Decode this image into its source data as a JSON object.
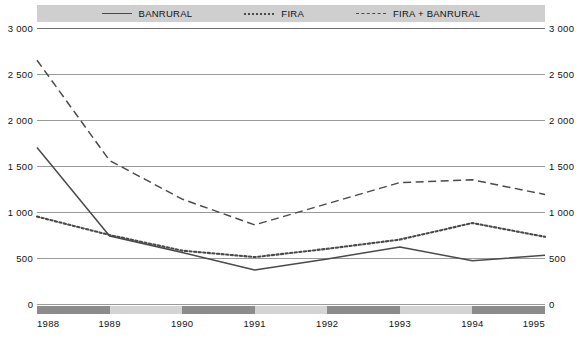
{
  "legend": {
    "items": [
      {
        "label": "BANRURAL",
        "style": "solid",
        "color": "#4a4a4a"
      },
      {
        "label": "FIRA",
        "style": "dotted",
        "color": "#4a4a4a"
      },
      {
        "label": "FIRA + BANRURAL",
        "style": "dashed",
        "color": "#4a4a4a"
      }
    ]
  },
  "axis": {
    "y_ticks_left": [
      "3 000",
      "2 500",
      "2 000",
      "1 500",
      "1 000",
      "500",
      "0"
    ],
    "y_ticks_right": [
      "3 000",
      "2 500",
      "2 000",
      "1 500",
      "1 000",
      "500",
      "0"
    ],
    "x_ticks": [
      "1988",
      "1989",
      "1990",
      "1991",
      "1992",
      "1993",
      "1994",
      "1995"
    ],
    "zero_left": "0",
    "zero_right": "0"
  },
  "chart_data": {
    "type": "line",
    "title": "",
    "subtitle": "",
    "xlabel": "",
    "ylabel": "",
    "x": [
      1988,
      1989,
      1990,
      1991,
      1992,
      1993,
      1994,
      1995
    ],
    "categories": [
      "1988",
      "1989",
      "1990",
      "1991",
      "1992",
      "1993",
      "1994",
      "1995"
    ],
    "ylim": [
      0,
      3000
    ],
    "ytick_values": [
      0,
      500,
      1000,
      1500,
      2000,
      2500,
      3000
    ],
    "grid": true,
    "legend_position": "top",
    "series": [
      {
        "name": "BANRURAL",
        "style": "solid",
        "color": "#4a4a4a",
        "values": [
          1700,
          740,
          560,
          370,
          490,
          620,
          470,
          530
        ]
      },
      {
        "name": "FIRA",
        "style": "dotted",
        "color": "#4a4a4a",
        "values": [
          950,
          750,
          580,
          510,
          600,
          700,
          880,
          730
        ]
      },
      {
        "name": "FIRA + BANRURAL",
        "style": "dashed",
        "color": "#4a4a4a",
        "values": [
          2650,
          1560,
          1140,
          860,
          1090,
          1320,
          1350,
          1190
        ]
      }
    ]
  },
  "xband": {
    "segments": [
      {
        "from": "1988",
        "to": "1989",
        "shade": "dark"
      },
      {
        "from": "1989",
        "to": "1990",
        "shade": "light"
      },
      {
        "from": "1990",
        "to": "1991",
        "shade": "dark"
      },
      {
        "from": "1991",
        "to": "1992",
        "shade": "light"
      },
      {
        "from": "1992",
        "to": "1993",
        "shade": "dark"
      },
      {
        "from": "1993",
        "to": "1994",
        "shade": "light"
      },
      {
        "from": "1994",
        "to": "1995",
        "shade": "dark"
      }
    ],
    "dark_color": "#8c8c8c",
    "light_color": "#d4d4d4"
  }
}
